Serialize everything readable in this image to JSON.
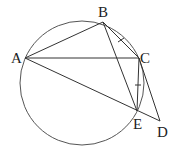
{
  "diagram": {
    "type": "geometry",
    "circle": {
      "cx": 82,
      "cy": 83,
      "r": 62
    },
    "points": {
      "A": {
        "label": "A",
        "x": 25,
        "y": 58,
        "lx": 11,
        "ly": 63
      },
      "B": {
        "label": "B",
        "x": 103,
        "y": 22,
        "lx": 98,
        "ly": 17
      },
      "C": {
        "label": "C",
        "x": 139,
        "y": 58,
        "lx": 140,
        "ly": 63
      },
      "E": {
        "label": "E",
        "x": 137,
        "y": 111,
        "lx": 133,
        "ly": 129
      },
      "D": {
        "label": "D",
        "x": 160,
        "y": 121,
        "lx": 157,
        "ly": 137
      }
    },
    "segments": [
      "AB",
      "AC",
      "AD",
      "BC",
      "BE",
      "CE",
      "CD"
    ],
    "equal_marks": [
      "BC",
      "CE"
    ]
  }
}
